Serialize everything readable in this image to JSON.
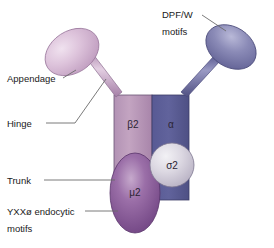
{
  "figure": {
    "background_color": "#ffffff"
  },
  "callouts": {
    "appendage": {
      "label": "Appendage"
    },
    "hinge": {
      "label": "Hinge"
    },
    "trunk": {
      "label": "Trunk"
    },
    "yxx_motifs": {
      "line1": "YXXø endocytic",
      "line2": "motifs"
    },
    "dpfw_motifs": {
      "line1": "DPF/W",
      "line2": "motifs"
    }
  },
  "subunits": {
    "beta2": {
      "label": "β2",
      "color": "#b08cb0"
    },
    "alpha": {
      "label": "α",
      "color": "#5a5a93"
    },
    "sigma2": {
      "label": "σ2",
      "color": "#c9c4d4"
    },
    "mu2": {
      "label": "μ2",
      "color": "#7b4f8e"
    }
  },
  "appendages": {
    "beta2_appendage": {
      "color": "#d6b7d4"
    },
    "alpha_appendage": {
      "color": "#7b7bac"
    }
  },
  "colors": {
    "leader_line": "#6b6b6b",
    "text": "#1a1a1a",
    "outline": "#4a3c55"
  }
}
